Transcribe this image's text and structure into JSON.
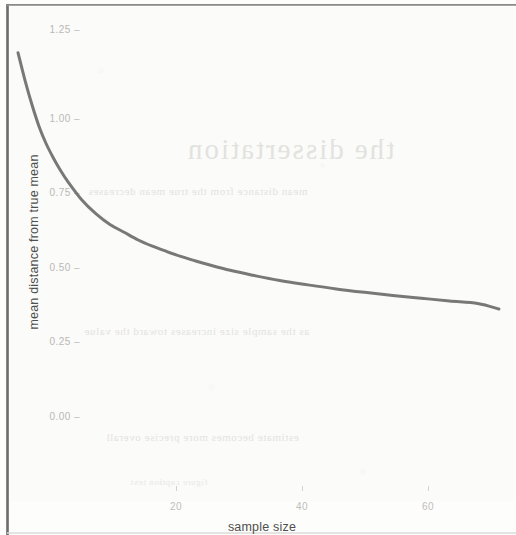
{
  "chart_data": {
    "type": "line",
    "title": "",
    "xlabel": "sample size",
    "ylabel": "mean distance from true mean",
    "xlim": [
      3,
      72
    ],
    "ylim": [
      0.0,
      1.3
    ],
    "xticks": [
      20,
      40,
      60
    ],
    "xtick_labels": [
      "20",
      "40",
      "60"
    ],
    "yticks": [
      0.0,
      0.25,
      0.5,
      0.75,
      1.0,
      1.25
    ],
    "ytick_labels": [
      "0.00",
      "0.25",
      "0.50",
      "0.75",
      "1.00",
      "1.25"
    ],
    "grid": false,
    "legend": null,
    "line_color": "#6d6d6b",
    "line_width": 3,
    "series": [
      {
        "name": "mean distance from true mean",
        "x": [
          3,
          4,
          5,
          6,
          7,
          8,
          9,
          10,
          12,
          14,
          16,
          18,
          20,
          22,
          24,
          26,
          28,
          30,
          33,
          36,
          40,
          44,
          48,
          52,
          56,
          60,
          64,
          68,
          71
        ],
        "y": [
          1.18,
          1.09,
          1.01,
          0.94,
          0.885,
          0.84,
          0.8,
          0.765,
          0.705,
          0.66,
          0.625,
          0.6,
          0.575,
          0.555,
          0.538,
          0.522,
          0.508,
          0.495,
          0.477,
          0.462,
          0.444,
          0.43,
          0.417,
          0.406,
          0.396,
          0.387,
          0.378,
          0.37,
          0.352
        ]
      }
    ]
  },
  "axes": {
    "x_title": "sample size",
    "y_title": "mean distance from true mean",
    "x_tick_labels": [
      "20",
      "40",
      "60"
    ],
    "y_tick_labels": [
      "1.25",
      "1.00",
      "0.75",
      "0.50",
      "0.25",
      "0.00"
    ]
  },
  "background_artifacts": {
    "ghost_heading": "the dissertation",
    "ghost_line_1": "mean distance from the true mean decreases",
    "ghost_line_2": "as the sample size increases toward the value",
    "ghost_line_3": "estimate becomes more precise overall",
    "ghost_line_4": "figure caption text"
  }
}
